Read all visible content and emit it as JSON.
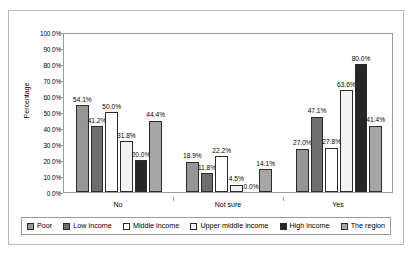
{
  "chart_data": {
    "type": "bar",
    "title": "",
    "xlabel": "",
    "ylabel": "Percentage",
    "ylim": [
      0,
      100
    ],
    "grid": false,
    "legend_position": "bottom",
    "value_suffix": "%",
    "categories": [
      "No",
      "Not sure",
      "Yes"
    ],
    "y_ticks": [
      "0.0%",
      "10.0%",
      "20.0%",
      "30.0%",
      "40.0%",
      "50.0%",
      "60.0%",
      "70.0%",
      "80.0%",
      "90.0%",
      "100.0%"
    ],
    "series": [
      {
        "name": "Poor",
        "color": "#969696",
        "values": [
          54.1,
          18.9,
          27.0
        ],
        "labels": [
          "54.1%",
          "18.9%",
          "27.0%"
        ]
      },
      {
        "name": "Low income",
        "color": "#6e6e6e",
        "values": [
          41.2,
          11.8,
          47.1
        ],
        "labels": [
          "41.2%",
          "11.8%",
          "47.1%"
        ]
      },
      {
        "name": "Middle income",
        "color": "#ffffff",
        "values": [
          50.0,
          22.2,
          27.8
        ],
        "labels": [
          "50.0%",
          "22.2%",
          "27.8%"
        ]
      },
      {
        "name": "Upper middle income",
        "color": "#f2f2f2",
        "values": [
          31.8,
          4.5,
          63.6
        ],
        "labels": [
          "31.8%",
          "4.5%",
          "63.6%"
        ]
      },
      {
        "name": "High income",
        "color": "#262626",
        "values": [
          20.0,
          0.0,
          80.0
        ],
        "labels": [
          "20.0%",
          "0.0%",
          "80.0%"
        ]
      },
      {
        "name": "The region",
        "color": "#a6a6a6",
        "values": [
          44.4,
          14.1,
          41.4
        ],
        "labels": [
          "44.4%",
          "14.1%",
          "41.4%"
        ]
      }
    ]
  }
}
